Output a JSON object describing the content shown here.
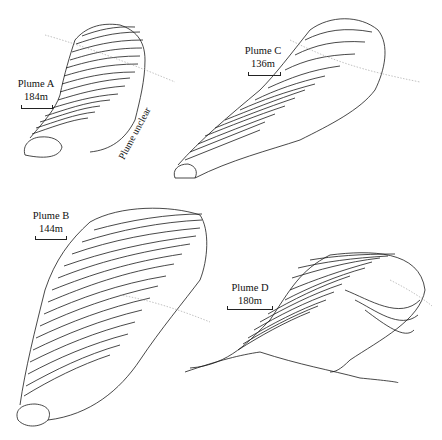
{
  "figure": {
    "panels": [
      {
        "id": "A",
        "name": "Plume A",
        "scale": "184m",
        "note": "Plume unclear"
      },
      {
        "id": "C",
        "name": "Plume C",
        "scale": "136m"
      },
      {
        "id": "B",
        "name": "Plume B",
        "scale": "144m"
      },
      {
        "id": "D",
        "name": "Plume D",
        "scale": "180m"
      }
    ]
  }
}
